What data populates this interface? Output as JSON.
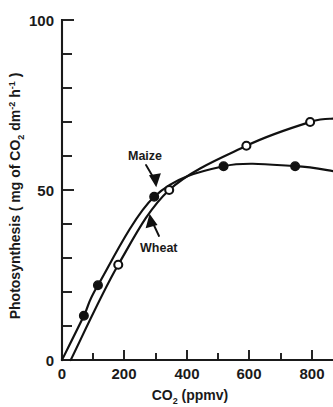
{
  "chart_data": {
    "type": "line",
    "title": "",
    "xlabel": "CO2 (ppmv)",
    "xlabel_parts": {
      "pre": "CO",
      "sub": "2",
      "post": " (ppmv)"
    },
    "ylabel": "Photosynthesis ( mg of CO2 dm-2 h-1 )",
    "ylabel_parts": {
      "p1": "Photosynthesis  ( mg of CO",
      "s1": "2",
      "p2": " dm",
      "s2": "-2",
      "p3": " h",
      "s3": "-1",
      "p4": " )"
    },
    "xlim": [
      0,
      870
    ],
    "ylim": [
      0,
      100
    ],
    "xticks": [
      0,
      200,
      400,
      600,
      800
    ],
    "xtick_labels": [
      "0",
      "200",
      "400",
      "600",
      "800"
    ],
    "x_minor_ticks": [
      100,
      300,
      500,
      700
    ],
    "yticks": [
      0,
      50,
      100
    ],
    "ytick_labels": [
      "0",
      "50",
      "100"
    ],
    "y_minor_ticks": [
      10,
      20,
      30,
      40,
      60,
      70,
      80,
      90
    ],
    "grid": false,
    "legend": "none",
    "series": [
      {
        "name": "Maize",
        "marker": "filled-circle",
        "values": [
          {
            "x": 70,
            "y": 13
          },
          {
            "x": 115,
            "y": 22
          },
          {
            "x": 295,
            "y": 48
          },
          {
            "x": 517,
            "y": 57
          },
          {
            "x": 746,
            "y": 57
          }
        ]
      },
      {
        "name": "Wheat",
        "marker": "open-circle",
        "values": [
          {
            "x": 180,
            "y": 28
          },
          {
            "x": 343,
            "y": 50
          },
          {
            "x": 590,
            "y": 63
          },
          {
            "x": 794,
            "y": 70
          }
        ]
      }
    ],
    "annotations": [
      {
        "text": "Maize",
        "points_to_series": "Maize",
        "x": 175,
        "y": 63
      },
      {
        "text": "Wheat",
        "points_to_series": "Wheat",
        "x": 200,
        "y": 33
      }
    ]
  },
  "axis": {
    "x_tick_labels": [
      "0",
      "200",
      "400",
      "600",
      "800"
    ],
    "y_tick_labels": [
      "100",
      "50",
      "0"
    ]
  },
  "annotations": {
    "maize": "Maize",
    "wheat": "Wheat"
  }
}
